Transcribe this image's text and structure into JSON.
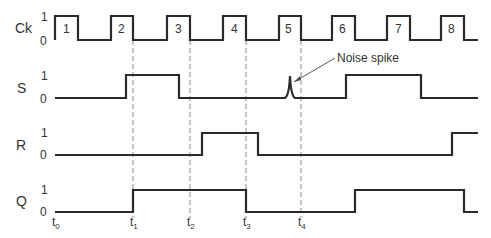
{
  "diagram": {
    "type": "timing-diagram",
    "signals": [
      {
        "name": "Ck",
        "high_label": "1",
        "low_label": "0"
      },
      {
        "name": "S",
        "high_label": "1",
        "low_label": "0"
      },
      {
        "name": "R",
        "high_label": "1",
        "low_label": "0"
      },
      {
        "name": "Q",
        "high_label": "1",
        "low_label": "0"
      }
    ],
    "clock_pulses": [
      "1",
      "2",
      "3",
      "4",
      "5",
      "6",
      "7",
      "8"
    ],
    "time_markers": [
      {
        "t": "t",
        "sub": "0"
      },
      {
        "t": "t",
        "sub": "1"
      },
      {
        "t": "t",
        "sub": "2"
      },
      {
        "t": "t",
        "sub": "3"
      },
      {
        "t": "t",
        "sub": "4"
      }
    ],
    "annotation": "Noise spike",
    "waveforms": {
      "Ck": [
        0,
        1,
        0,
        1,
        0,
        1,
        0,
        1,
        0,
        1,
        0,
        1,
        0,
        1,
        0,
        1,
        0
      ],
      "S_transitions": [
        {
          "x": "126",
          "to": 1
        },
        {
          "x": "179",
          "to": 0
        },
        {
          "x": "290",
          "spike": true
        },
        {
          "x": "346",
          "to": 1
        },
        {
          "x": "421",
          "to": 0
        }
      ],
      "R_transitions": [
        {
          "x": "202",
          "to": 1
        },
        {
          "x": "258",
          "to": 0
        },
        {
          "x": "452",
          "to": 1
        }
      ],
      "Q_transitions": [
        {
          "x": "133",
          "to": 1
        },
        {
          "x": "246",
          "to": 0
        },
        {
          "x": "355",
          "to": 1
        },
        {
          "x": "464",
          "to": 0
        }
      ]
    },
    "colors": {
      "trace": "#2a2a2a",
      "guide": "#8a8a8a",
      "background": "#ffffff"
    }
  }
}
